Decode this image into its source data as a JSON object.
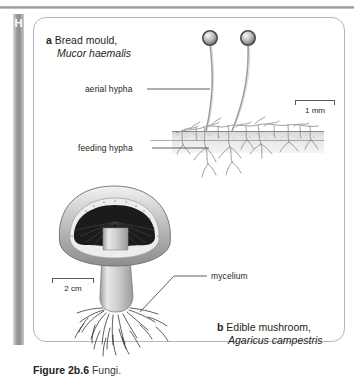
{
  "page": {
    "margin_letter": "H",
    "caption_number": "Figure 2b.6",
    "caption_text": "Fungi."
  },
  "panel_a": {
    "marker": "a",
    "common_name": "Bread mould,",
    "species": "Mucor haemalis",
    "labels": [
      {
        "id": "aerial-hypha",
        "text": "aerial hypha"
      },
      {
        "id": "feeding-hypha",
        "text": "feeding hypha"
      }
    ],
    "scale": {
      "value": "1 mm"
    }
  },
  "panel_b": {
    "marker": "b",
    "common_name": "Edible mushroom,",
    "species": "Agaricus campestris",
    "labels": [
      {
        "id": "mycelium",
        "text": "mycelium"
      }
    ],
    "scale": {
      "value": "2 cm"
    }
  },
  "colors": {
    "rule": "#9d9d9d",
    "side_bar": "#8e8e8e",
    "panel_border": "#b6b6b6",
    "text": "#231f20",
    "leader": "#4d4d4d",
    "hypha": "#8c8c92",
    "soil": "#e2e2e2",
    "mushroom_cap": "#b5b5b5",
    "gills": "#1c1c1c"
  }
}
